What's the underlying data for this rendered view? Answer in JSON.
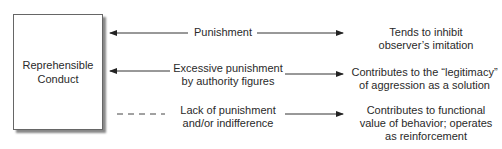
{
  "diagram": {
    "source_box": {
      "label_line1": "Reprehensible",
      "label_line2": "Conduct"
    },
    "rows": [
      {
        "cause_line1": "Punishment",
        "cause_line2": "",
        "left_connector": "solid-arrow-to-box",
        "effect_line1": "Tends to inhibit",
        "effect_line2": "observer’s imitation",
        "effect_line3": ""
      },
      {
        "cause_line1": "Excessive punishment",
        "cause_line2": "by authority figures",
        "left_connector": "solid-arrow-to-box",
        "effect_line1": "Contributes to the “legitimacy”",
        "effect_line2": "of aggression as a solution",
        "effect_line3": ""
      },
      {
        "cause_line1": "Lack of punishment",
        "cause_line2": "and/or indifference",
        "left_connector": "dashed-line-no-arrow",
        "effect_line1": "Contributes to functional",
        "effect_line2": "value of behavior; operates",
        "effect_line3": "as reinforcement"
      }
    ]
  }
}
